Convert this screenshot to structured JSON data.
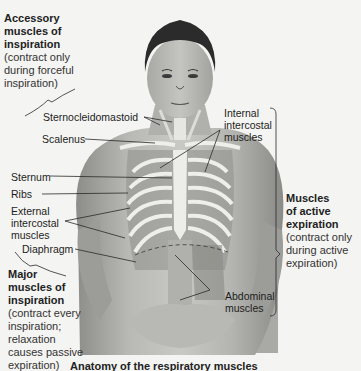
{
  "figure": {
    "groups": {
      "accessory_inspiration": {
        "title_lines": [
          "Accessory",
          "muscles of",
          "inspiration"
        ],
        "note_lines": [
          "(contract only",
          "during forceful",
          "inspiration)"
        ]
      },
      "major_inspiration": {
        "title_lines": [
          "Major",
          "muscles of",
          "inspiration"
        ],
        "note_lines": [
          "(contract every",
          "inspiration;",
          "relaxation",
          "causes passive",
          "expiration)"
        ]
      },
      "active_expiration": {
        "title_lines": [
          "Muscles",
          "of active",
          "expiration"
        ],
        "note_lines": [
          "(contract only",
          "during active",
          "expiration)"
        ]
      }
    },
    "labels": {
      "sternocleidomastoid": "Sternocleidomastoid",
      "scalenus": "Scalenus",
      "sternum": "Sternum",
      "ribs": "Ribs",
      "external_intercostal": [
        "External",
        "intercostal",
        "muscles"
      ],
      "diaphragm": "Diaphragm",
      "internal_intercostal": [
        "Internal",
        "intercostal",
        "muscles"
      ],
      "abdominal": [
        "Abdominal",
        "muscles"
      ]
    },
    "caption": "Anatomy of the respiratory muscles"
  },
  "colors": {
    "page": "#f4f4f2",
    "skin": "#bcbcb8",
    "skin_dark": "#8f8f8b",
    "hair": "#2b2b2b",
    "rib": "#ececea",
    "muscle": "#9a9a96",
    "leader": "#2a2a2a"
  }
}
